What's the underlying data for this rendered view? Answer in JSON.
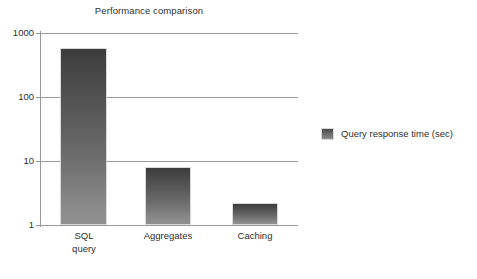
{
  "chart_data": {
    "type": "bar",
    "title": "Performance comparison",
    "xlabel": "",
    "ylabel": "",
    "yscale": "log",
    "ylim": [
      1,
      1000
    ],
    "yticks": [
      "1",
      "10",
      "100",
      "1000"
    ],
    "grid": true,
    "legend_position": "right",
    "categories": [
      "SQL\nquery",
      "Aggregates",
      "Caching"
    ],
    "series": [
      {
        "name": "Query response time (sec)",
        "values": [
          580,
          8.2,
          2.2
        ]
      }
    ]
  },
  "legend": {
    "entries": [
      {
        "label": "Query response time (sec)",
        "color": "#6e6e6e"
      }
    ]
  },
  "colors": {
    "bar_top": "#3c3c3c",
    "bar_bottom": "#909090",
    "axis": "#9a9a9a",
    "text": "#2e2e2e",
    "background": "#ffffff"
  }
}
